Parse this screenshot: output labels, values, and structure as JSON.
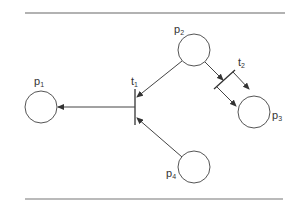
{
  "diagram": {
    "type": "petri-net",
    "places": [
      {
        "id": "p1",
        "label": "p",
        "sub": "1"
      },
      {
        "id": "p2",
        "label": "p",
        "sub": "2"
      },
      {
        "id": "p3",
        "label": "p",
        "sub": "3"
      },
      {
        "id": "p4",
        "label": "p",
        "sub": "4"
      }
    ],
    "transitions": [
      {
        "id": "t1",
        "label": "t",
        "sub": "1"
      },
      {
        "id": "t2",
        "label": "t",
        "sub": "2"
      }
    ],
    "arcs": [
      {
        "from": "p2",
        "to": "t1"
      },
      {
        "from": "p4",
        "to": "t1"
      },
      {
        "from": "t1",
        "to": "p1"
      },
      {
        "from": "p2",
        "to": "t2"
      },
      {
        "from": "t2",
        "to": "p3"
      },
      {
        "from": "t2",
        "to": "p3"
      }
    ],
    "colors": {
      "stroke": "#444444",
      "background": "#ffffff"
    }
  }
}
